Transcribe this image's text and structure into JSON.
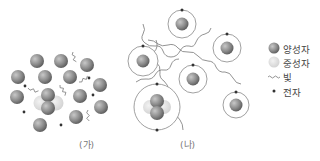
{
  "panels": {
    "a": {
      "label": "(가)",
      "protons": [
        [
          37,
          61
        ],
        [
          61,
          61
        ],
        [
          87,
          65
        ],
        [
          18,
          77
        ],
        [
          45,
          77
        ],
        [
          70,
          77
        ],
        [
          100,
          85
        ],
        [
          48,
          95
        ],
        [
          80,
          96
        ],
        [
          17,
          97
        ],
        [
          101,
          107
        ],
        [
          48,
          108
        ],
        [
          76,
          117
        ],
        [
          40,
          125
        ]
      ],
      "neutrons": [
        [
          41,
          103
        ],
        [
          56,
          103
        ]
      ],
      "electrons": [
        [
          25,
          86
        ],
        [
          89,
          78
        ],
        [
          93,
          95
        ],
        [
          24,
          112
        ],
        [
          61,
          125
        ]
      ],
      "waves": [
        [
          [
            73,
            52
          ],
          [
            75,
            62
          ]
        ],
        [
          [
            28,
            88
          ],
          [
            38,
            92
          ]
        ],
        [
          [
            60,
            85
          ],
          [
            66,
            95
          ]
        ],
        [
          [
            79,
            82
          ],
          [
            88,
            77
          ]
        ],
        [
          [
            88,
            110
          ],
          [
            88,
            121
          ]
        ]
      ]
    },
    "b": {
      "label": "(나)",
      "atoms": [
        {
          "x": 182,
          "y": 24,
          "r": 14,
          "nucleus": "H"
        },
        {
          "x": 143,
          "y": 61,
          "r": 15,
          "nucleus": "H"
        },
        {
          "x": 227,
          "y": 48,
          "r": 14,
          "nucleus": "H"
        },
        {
          "x": 193,
          "y": 79,
          "r": 14,
          "nucleus": "H"
        },
        {
          "x": 157,
          "y": 107,
          "r": 23,
          "nucleus": "He"
        },
        {
          "x": 236,
          "y": 105,
          "r": 13,
          "nucleus": "H"
        }
      ]
    }
  },
  "legend": {
    "items": [
      {
        "label": "양성자",
        "symbol": "proton"
      },
      {
        "label": "중성자",
        "symbol": "neutron"
      },
      {
        "label": "빛",
        "symbol": "light"
      },
      {
        "label": "전자",
        "symbol": "electron"
      }
    ]
  },
  "colors": {
    "proton": "#8a8a8a",
    "neutron": "#d6d6d6",
    "electron": "#333333",
    "orbit": "#888888",
    "wave": "#777777"
  }
}
